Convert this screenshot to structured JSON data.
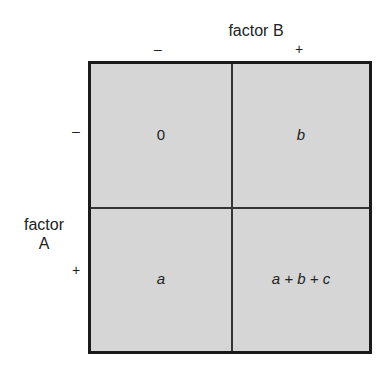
{
  "factor_b": {
    "label": "factor B",
    "levels": [
      "–",
      "+"
    ]
  },
  "factor_a": {
    "label_line1": "factor",
    "label_line2": "A",
    "levels": [
      "–",
      "+"
    ]
  },
  "cells": {
    "minus_minus": "0",
    "minus_plus": "b",
    "plus_minus": "a",
    "plus_plus": "a + b + c"
  },
  "colors": {
    "cell_fill": "#d6d6d6",
    "border": "#1a1a1a"
  }
}
